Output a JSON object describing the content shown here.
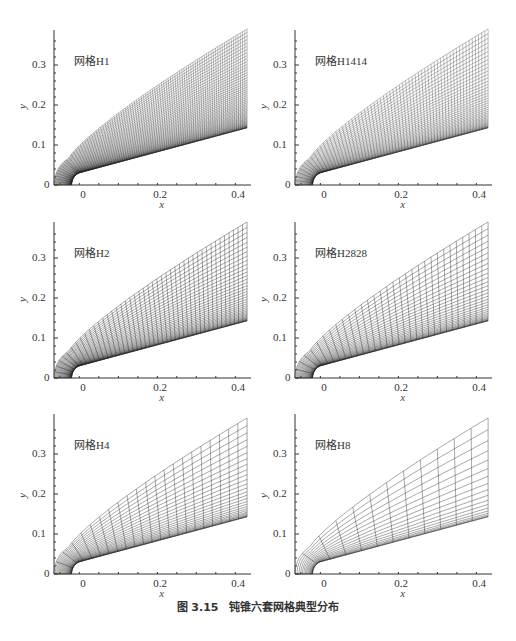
{
  "figure": {
    "caption": "图 3.15　钝锥六套网格典型分布"
  },
  "chart_data": [
    {
      "type": "mesh",
      "label": "网格H1",
      "xlabel": "x",
      "ylabel": "y",
      "xlim": [
        -0.07,
        0.42
      ],
      "ylim": [
        0,
        0.39
      ],
      "xticks": [
        "0",
        "0.2",
        "0.4"
      ],
      "yticks": [
        "0",
        "0.1",
        "0.2",
        "0.3"
      ],
      "density": {
        "radial": 60,
        "streamwise": 90
      }
    },
    {
      "type": "mesh",
      "label": "网格H1414",
      "xlabel": "x",
      "ylabel": "y",
      "xlim": [
        -0.07,
        0.42
      ],
      "ylim": [
        0,
        0.39
      ],
      "xticks": [
        "0",
        "0.2",
        "0.4"
      ],
      "yticks": [
        "0",
        "0.1",
        "0.2",
        "0.3"
      ],
      "density": {
        "radial": 45,
        "streamwise": 64
      }
    },
    {
      "type": "mesh",
      "label": "网格H2",
      "xlabel": "x",
      "ylabel": "y",
      "xlim": [
        -0.07,
        0.42
      ],
      "ylim": [
        0,
        0.39
      ],
      "xticks": [
        "0",
        "0.2",
        "0.4"
      ],
      "yticks": [
        "0",
        "0.1",
        "0.2",
        "0.3"
      ],
      "density": {
        "radial": 40,
        "streamwise": 45
      }
    },
    {
      "type": "mesh",
      "label": "网格H2828",
      "xlabel": "x",
      "ylabel": "y",
      "xlim": [
        -0.07,
        0.42
      ],
      "ylim": [
        0,
        0.39
      ],
      "xticks": [
        "0",
        "0.2",
        "0.4"
      ],
      "yticks": [
        "0",
        "0.1",
        "0.2",
        "0.3"
      ],
      "density": {
        "radial": 32,
        "streamwise": 32
      }
    },
    {
      "type": "mesh",
      "label": "网格H4",
      "xlabel": "x",
      "ylabel": "y",
      "xlim": [
        -0.07,
        0.42
      ],
      "ylim": [
        0,
        0.39
      ],
      "xticks": [
        "0",
        "0.2",
        "0.4"
      ],
      "yticks": [
        "0",
        "0.1",
        "0.2",
        "0.3"
      ],
      "density": {
        "radial": 28,
        "streamwise": 22
      }
    },
    {
      "type": "mesh",
      "label": "网格H8",
      "xlabel": "x",
      "ylabel": "y",
      "xlim": [
        -0.07,
        0.42
      ],
      "ylim": [
        0,
        0.39
      ],
      "xticks": [
        "0",
        "0.2",
        "0.4"
      ],
      "yticks": [
        "0",
        "0.1",
        "0.2",
        "0.3"
      ],
      "density": {
        "radial": 18,
        "streamwise": 12
      }
    }
  ],
  "panels": [
    {
      "label": "网格H1",
      "x": "x",
      "y": "y",
      "xt0": "0",
      "xt1": "0.2",
      "xt2": "0.4",
      "yt0": "0",
      "yt1": "0.1",
      "yt2": "0.2",
      "yt3": "0.3"
    },
    {
      "label": "网格H1414",
      "x": "x",
      "y": "y",
      "xt0": "0",
      "xt1": "0.2",
      "xt2": "0.4",
      "yt0": "0",
      "yt1": "0.1",
      "yt2": "0.2",
      "yt3": "0.3"
    },
    {
      "label": "网格H2",
      "x": "x",
      "y": "y",
      "xt0": "0",
      "xt1": "0.2",
      "xt2": "0.4",
      "yt0": "0",
      "yt1": "0.1",
      "yt2": "0.2",
      "yt3": "0.3"
    },
    {
      "label": "网格H2828",
      "x": "x",
      "y": "y",
      "xt0": "0",
      "xt1": "0.2",
      "xt2": "0.4",
      "yt0": "0",
      "yt1": "0.1",
      "yt2": "0.2",
      "yt3": "0.3"
    },
    {
      "label": "网格H4",
      "x": "x",
      "y": "y",
      "xt0": "0",
      "xt1": "0.2",
      "xt2": "0.4",
      "yt0": "0",
      "yt1": "0.1",
      "yt2": "0.2",
      "yt3": "0.3"
    },
    {
      "label": "网格H8",
      "x": "x",
      "y": "y",
      "xt0": "0",
      "xt1": "0.2",
      "xt2": "0.4",
      "yt0": "0",
      "yt1": "0.1",
      "yt2": "0.2",
      "yt3": "0.3"
    }
  ]
}
